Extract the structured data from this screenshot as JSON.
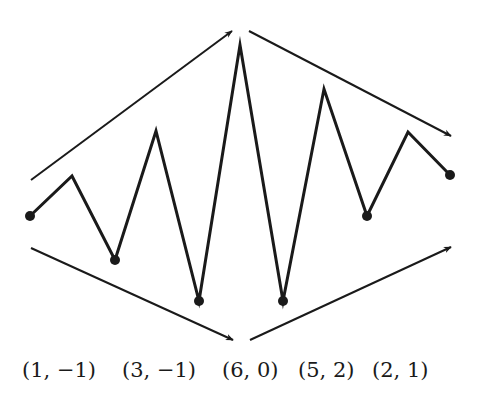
{
  "diagram": {
    "stroke_color": "#1a1a1a",
    "background": "#ffffff",
    "zigzag": {
      "points": [
        [
          30,
          216
        ],
        [
          72,
          176
        ],
        [
          115,
          260
        ],
        [
          156,
          131
        ],
        [
          199,
          301
        ],
        [
          240,
          45
        ],
        [
          283,
          301
        ],
        [
          324,
          89
        ],
        [
          367,
          216
        ],
        [
          408,
          132
        ],
        [
          450,
          175
        ]
      ],
      "dot_indices": [
        0,
        2,
        4,
        6,
        8,
        10
      ]
    },
    "arrows": [
      {
        "name": "upper-left-arrow",
        "from": [
          31,
          180
        ],
        "to": [
          232,
          31
        ]
      },
      {
        "name": "upper-right-arrow",
        "from": [
          249,
          31
        ],
        "to": [
          451,
          136
        ]
      },
      {
        "name": "lower-left-arrow",
        "from": [
          31,
          248
        ],
        "to": [
          233,
          340
        ]
      },
      {
        "name": "lower-right-arrow",
        "from": [
          250,
          340
        ],
        "to": [
          451,
          247
        ]
      }
    ],
    "labels": [
      {
        "text": "(1, −1)",
        "x": 22
      },
      {
        "text": "(3, −1)",
        "x": 122
      },
      {
        "text": "(6, 0)",
        "x": 222
      },
      {
        "text": "(5, 2)",
        "x": 298
      },
      {
        "text": "(2, 1)",
        "x": 372
      }
    ]
  }
}
